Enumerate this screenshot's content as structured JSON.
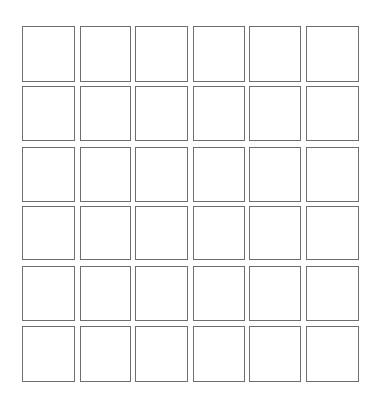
{
  "grid": {
    "rows": 6,
    "cols": 6,
    "col_lefts": [
      22,
      80,
      135,
      193,
      249,
      306
    ],
    "col_widths": [
      53,
      51,
      53,
      52,
      52,
      53
    ],
    "row_tops": [
      26,
      86,
      147,
      206,
      266,
      326
    ],
    "row_heights": [
      56,
      55,
      55,
      54,
      55,
      56
    ],
    "cell_border_color": "#6e6e6e",
    "cell_fill_color": "#ffffff",
    "cells": [
      [
        "",
        "",
        "",
        "",
        "",
        ""
      ],
      [
        "",
        "",
        "",
        "",
        "",
        ""
      ],
      [
        "",
        "",
        "",
        "",
        "",
        ""
      ],
      [
        "",
        "",
        "",
        "",
        "",
        ""
      ],
      [
        "",
        "",
        "",
        "",
        "",
        ""
      ],
      [
        "",
        "",
        "",
        "",
        "",
        ""
      ]
    ]
  }
}
